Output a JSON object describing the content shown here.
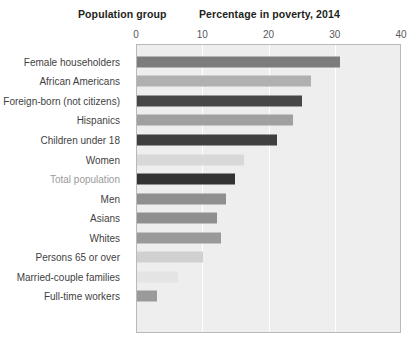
{
  "headers": {
    "group": "Population group",
    "value": "Percentage in poverty, 2014"
  },
  "chart_data": {
    "type": "bar",
    "orientation": "horizontal",
    "title": "Percentage in poverty, 2014",
    "xlabel": "Percentage in poverty, 2014",
    "ylabel": "Population group",
    "xlim": [
      0,
      40
    ],
    "ticks": [
      "0",
      "10",
      "20",
      "30",
      "40"
    ],
    "tick_values": [
      0,
      10,
      20,
      30,
      40
    ],
    "grid": true,
    "gridlines_at": [
      10,
      20,
      30
    ],
    "legend": "none",
    "plot_background": "#eeeeee",
    "categories": [
      "Female householders",
      "African Americans",
      "Foreign-born (not citizens)",
      "Hispanics",
      "Children under 18",
      "Women",
      "Total population",
      "Men",
      "Asians",
      "Whites",
      "Persons 65 or over",
      "Married-couple families",
      "Full-time workers"
    ],
    "values": [
      30.6,
      26.2,
      24.9,
      23.6,
      21.1,
      16.1,
      14.8,
      13.4,
      12.0,
      12.7,
      10.0,
      6.2,
      3.0
    ],
    "bar_colors": [
      "#7c7c7c",
      "#b0b0b0",
      "#474747",
      "#a0a0a0",
      "#3f3f3f",
      "#d8d8d8",
      "#333333",
      "#8f8f8f",
      "#8f8f8f",
      "#9a9a9a",
      "#d0d0d0",
      "#e4e4e4",
      "#9a9a9a"
    ],
    "label_muted": [
      false,
      false,
      false,
      false,
      false,
      false,
      true,
      false,
      false,
      false,
      false,
      false,
      false
    ]
  }
}
